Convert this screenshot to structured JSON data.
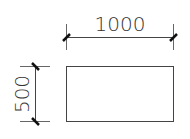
{
  "drawing": {
    "width_dimension": {
      "label": "1000"
    },
    "height_dimension": {
      "label": "500"
    },
    "colors": {
      "line": "#444444",
      "tick": "#111111",
      "text": "#333333",
      "background": "#ffffff"
    }
  }
}
